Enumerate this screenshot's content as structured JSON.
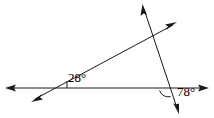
{
  "figure": {
    "width": 214,
    "height": 118,
    "background": "#ffffff",
    "stroke_color": "#1a1a1a",
    "stroke_width": 1
  },
  "diagram": {
    "type": "geometry-angles",
    "points": {
      "left_vertex": {
        "x": 58,
        "y": 88
      },
      "right_vertex": {
        "x": 168,
        "y": 88
      },
      "upper_intersection": {
        "x": 155,
        "y": 32
      }
    },
    "lines": [
      {
        "name": "horizontal-line",
        "from": {
          "x": 6,
          "y": 88
        },
        "to": {
          "x": 208,
          "y": 88
        },
        "arrow_start": true,
        "arrow_end": true
      },
      {
        "name": "slanted-ray",
        "from": {
          "x": 32,
          "y": 101
        },
        "to": {
          "x": 176,
          "y": 23
        },
        "arrow_start": true,
        "arrow_end": true
      },
      {
        "name": "transversal-line",
        "from": {
          "x": 143,
          "y": 6
        },
        "to": {
          "x": 178,
          "y": 112
        },
        "arrow_start": true,
        "arrow_end": true
      }
    ],
    "marks": [
      {
        "name": "angle-tick-28",
        "kind": "tick",
        "x": 67,
        "y_top": 81,
        "y_bottom": 88
      },
      {
        "name": "angle-arc-78",
        "kind": "arc",
        "center": {
          "x": 168,
          "y": 88
        },
        "radius": 9
      }
    ]
  },
  "labels": {
    "angle_left": {
      "text": "28°",
      "value": 28,
      "unit": "degrees",
      "at_vertex": "left_vertex"
    },
    "angle_right": {
      "text": "78°",
      "value": 78,
      "unit": "degrees",
      "at_vertex": "right_vertex"
    }
  }
}
